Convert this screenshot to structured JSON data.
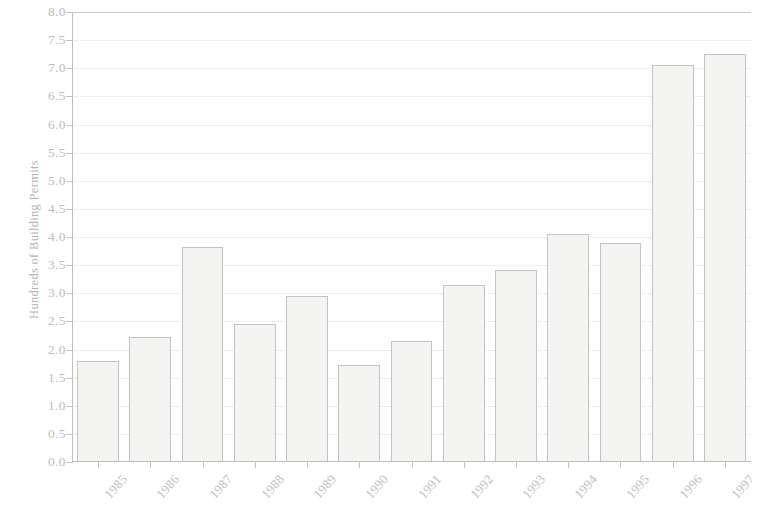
{
  "chart_data": {
    "type": "bar",
    "title": "",
    "subtitle": "",
    "xlabel": "",
    "ylabel": "Hundreds of Building Permits",
    "categories": [
      "1985",
      "1986",
      "1987",
      "1988",
      "1989",
      "1990",
      "1991",
      "1992",
      "1993",
      "1994",
      "1995",
      "1996",
      "1997"
    ],
    "values": [
      1.8,
      2.22,
      3.82,
      2.45,
      2.95,
      1.72,
      2.15,
      3.15,
      3.42,
      4.05,
      3.9,
      7.05,
      7.25
    ],
    "series": [
      {
        "name": "Building Permits",
        "values": [
          1.8,
          2.22,
          3.82,
          2.45,
          2.95,
          1.72,
          2.15,
          3.15,
          3.42,
          4.05,
          3.9,
          7.05,
          7.25
        ]
      }
    ],
    "ylim": [
      0.0,
      8.0
    ],
    "ytick_labels": [
      "0.0",
      "0.5",
      "1.0",
      "1.5",
      "2.0",
      "2.5",
      "3.0",
      "3.5",
      "4.0",
      "4.5",
      "5.0",
      "5.5",
      "6.0",
      "6.5",
      "7.0",
      "7.5",
      "8.0"
    ],
    "ytick_values": [
      0.0,
      0.5,
      1.0,
      1.5,
      2.0,
      2.5,
      3.0,
      3.5,
      4.0,
      4.5,
      5.0,
      5.5,
      6.0,
      6.5,
      7.0,
      7.5,
      8.0
    ],
    "ytick_step": 0.5,
    "xtick_labels": [
      "1985",
      "1986",
      "1987",
      "1988",
      "1989",
      "1990",
      "1991",
      "1992",
      "1993",
      "1994",
      "1995",
      "1996",
      "1997"
    ],
    "xtick_label_rotation_degrees": -48,
    "grid": true,
    "grid_axis": "y",
    "grid_style": "dotted",
    "legend": false,
    "legend_position": "none",
    "bar_fill_color": "#f4f4f3",
    "bar_edge_color": "#c3c3c1",
    "grid_color": "#dededc",
    "axis_color": "#c0c0c0",
    "text_color": "#bdbdbd",
    "background_color": "#ffffff"
  }
}
